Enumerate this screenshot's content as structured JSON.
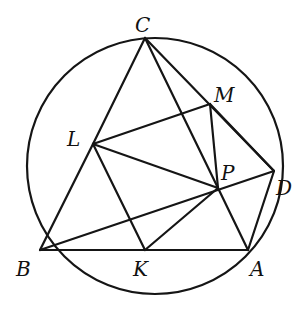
{
  "diagram": {
    "type": "geometry",
    "circle": {
      "cx": 155,
      "cy": 166,
      "r": 128
    },
    "points": {
      "C": {
        "x": 145,
        "y": 38
      },
      "M": {
        "x": 210,
        "y": 104
      },
      "L": {
        "x": 93,
        "y": 144
      },
      "P": {
        "x": 218,
        "y": 188
      },
      "D": {
        "x": 274,
        "y": 171
      },
      "B": {
        "x": 40,
        "y": 250
      },
      "K": {
        "x": 145,
        "y": 250
      },
      "A": {
        "x": 248,
        "y": 250
      }
    },
    "labels": {
      "C": "C",
      "M": "M",
      "L": "L",
      "P": "P",
      "D": "D",
      "B": "B",
      "K": "K",
      "A": "A"
    },
    "segments": [
      [
        "C",
        "L"
      ],
      [
        "L",
        "B"
      ],
      [
        "B",
        "A"
      ],
      [
        "C",
        "P"
      ],
      [
        "P",
        "A"
      ],
      [
        "C",
        "D"
      ],
      [
        "L",
        "M"
      ],
      [
        "M",
        "P"
      ],
      [
        "L",
        "P"
      ],
      [
        "L",
        "K"
      ],
      [
        "K",
        "P"
      ],
      [
        "B",
        "D"
      ],
      [
        "D",
        "A"
      ],
      [
        "M",
        "D"
      ]
    ]
  }
}
